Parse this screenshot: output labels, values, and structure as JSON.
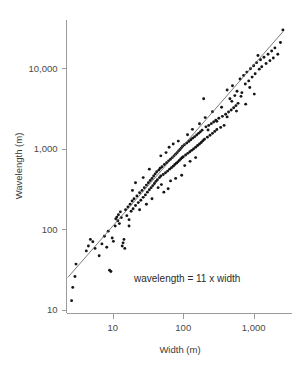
{
  "chart_data": {
    "type": "scatter",
    "title": "",
    "xlabel": "Width (m)",
    "ylabel": "Wavelength (m)",
    "xscale": "log",
    "yscale": "log",
    "xlim": [
      2.2,
      3500
    ],
    "ylim": [
      9,
      40000
    ],
    "grid": false,
    "legend": null,
    "xticks": [
      10,
      100,
      1000
    ],
    "xticklabels": [
      "10",
      "100",
      "1,000"
    ],
    "yticks": [
      10,
      100,
      1000,
      10000
    ],
    "yticklabels": [
      "10",
      "100",
      "1,000",
      "10,000"
    ],
    "annotation": "wavelength = 11 x width",
    "annotation_x": 20,
    "annotation_y": 22,
    "fit": {
      "label": "wavelength = 11 x width",
      "slope": 1,
      "intercept": 11,
      "x_start": 2.3,
      "x_end": 2600
    },
    "point_color": "#151515",
    "line_color": "#5a5a5a",
    "axis_color": "#9a9a9a",
    "text_color": "#4a4a4a",
    "points": [
      [
        2.6,
        13
      ],
      [
        2.7,
        19
      ],
      [
        2.9,
        26
      ],
      [
        3.0,
        37
      ],
      [
        4.2,
        54
      ],
      [
        4.5,
        62
      ],
      [
        4.8,
        75
      ],
      [
        5.2,
        70
      ],
      [
        5.6,
        58
      ],
      [
        6.4,
        47
      ],
      [
        7.0,
        66
      ],
      [
        7.6,
        82
      ],
      [
        8.2,
        60
      ],
      [
        8.6,
        95
      ],
      [
        9.0,
        31
      ],
      [
        9.4,
        30
      ],
      [
        9.8,
        78
      ],
      [
        10.2,
        71
      ],
      [
        10.8,
        110
      ],
      [
        11.0,
        135
      ],
      [
        11.4,
        142
      ],
      [
        11.8,
        128
      ],
      [
        12.0,
        152
      ],
      [
        12.4,
        118
      ],
      [
        12.8,
        165
      ],
      [
        13.2,
        140
      ],
      [
        13.6,
        62
      ],
      [
        14.0,
        68
      ],
      [
        14.4,
        75
      ],
      [
        14.8,
        58
      ],
      [
        15.2,
        175
      ],
      [
        15.8,
        148
      ],
      [
        16.4,
        190
      ],
      [
        17.0,
        132
      ],
      [
        17.6,
        205
      ],
      [
        18.2,
        168
      ],
      [
        18.8,
        225
      ],
      [
        19.4,
        180
      ],
      [
        20.0,
        240
      ],
      [
        21.0,
        198
      ],
      [
        22.0,
        260
      ],
      [
        23.0,
        215
      ],
      [
        24.0,
        285
      ],
      [
        25.0,
        230
      ],
      [
        26.0,
        305
      ],
      [
        27.0,
        250
      ],
      [
        28.0,
        330
      ],
      [
        29.0,
        268
      ],
      [
        30.0,
        355
      ],
      [
        31.0,
        290
      ],
      [
        32.0,
        380
      ],
      [
        33.0,
        310
      ],
      [
        34.0,
        405
      ],
      [
        35.0,
        330
      ],
      [
        36.0,
        430
      ],
      [
        37.0,
        350
      ],
      [
        38.0,
        460
      ],
      [
        39.0,
        372
      ],
      [
        40.0,
        490
      ],
      [
        41.0,
        395
      ],
      [
        42.0,
        520
      ],
      [
        43.0,
        415
      ],
      [
        44.0,
        330
      ],
      [
        45.0,
        545
      ],
      [
        46.0,
        440
      ],
      [
        47.0,
        575
      ],
      [
        48.0,
        460
      ],
      [
        49.0,
        360
      ],
      [
        50.0,
        600
      ],
      [
        52.0,
        480
      ],
      [
        54.0,
        640
      ],
      [
        56.0,
        505
      ],
      [
        58.0,
        675
      ],
      [
        60.0,
        530
      ],
      [
        62.0,
        710
      ],
      [
        64.0,
        560
      ],
      [
        66.0,
        745
      ],
      [
        68.0,
        585
      ],
      [
        70.0,
        780
      ],
      [
        72.0,
        610
      ],
      [
        74.0,
        820
      ],
      [
        76.0,
        640
      ],
      [
        78.0,
        860
      ],
      [
        80.0,
        665
      ],
      [
        82.0,
        900
      ],
      [
        84.0,
        690
      ],
      [
        86.0,
        945
      ],
      [
        88.0,
        720
      ],
      [
        90.0,
        985
      ],
      [
        92.0,
        750
      ],
      [
        94.0,
        1030
      ],
      [
        96.0,
        775
      ],
      [
        98.0,
        1080
      ],
      [
        100.0,
        800
      ],
      [
        104.0,
        1130
      ],
      [
        108.0,
        840
      ],
      [
        112.0,
        1180
      ],
      [
        116.0,
        880
      ],
      [
        120.0,
        1240
      ],
      [
        124.0,
        920
      ],
      [
        128.0,
        1300
      ],
      [
        132.0,
        960
      ],
      [
        136.0,
        1360
      ],
      [
        140.0,
        1000
      ],
      [
        145.0,
        1420
      ],
      [
        150.0,
        1050
      ],
      [
        155.0,
        1490
      ],
      [
        160.0,
        1100
      ],
      [
        165.0,
        1560
      ],
      [
        170.0,
        1150
      ],
      [
        175.0,
        1630
      ],
      [
        180.0,
        1200
      ],
      [
        185.0,
        1710
      ],
      [
        190.0,
        1260
      ],
      [
        195.0,
        4200
      ],
      [
        200.0,
        1320
      ],
      [
        210.0,
        1880
      ],
      [
        220.0,
        1400
      ],
      [
        230.0,
        1960
      ],
      [
        240.0,
        1480
      ],
      [
        250.0,
        2060
      ],
      [
        260.0,
        1560
      ],
      [
        270.0,
        2160
      ],
      [
        280.0,
        1650
      ],
      [
        290.0,
        2270
      ],
      [
        300.0,
        1740
      ],
      [
        320.0,
        2400
      ],
      [
        340.0,
        1850
      ],
      [
        360.0,
        2540
      ],
      [
        380.0,
        1960
      ],
      [
        400.0,
        2700
      ],
      [
        420.0,
        5400
      ],
      [
        440.0,
        2870
      ],
      [
        460.0,
        4200
      ],
      [
        480.0,
        3050
      ],
      [
        500.0,
        6100
      ],
      [
        520.0,
        3250
      ],
      [
        540.0,
        4600
      ],
      [
        560.0,
        3450
      ],
      [
        580.0,
        5200
      ],
      [
        600.0,
        3680
      ],
      [
        640.0,
        7400
      ],
      [
        680.0,
        5000
      ],
      [
        720.0,
        8200
      ],
      [
        760.0,
        6400
      ],
      [
        800.0,
        9000
      ],
      [
        850.0,
        7000
      ],
      [
        900.0,
        9900
      ],
      [
        950.0,
        7800
      ],
      [
        1000.0,
        10800
      ],
      [
        1050.0,
        8600
      ],
      [
        1100.0,
        11800
      ],
      [
        1150.0,
        14500
      ],
      [
        1200.0,
        9800
      ],
      [
        1250.0,
        12800
      ],
      [
        1300.0,
        10500
      ],
      [
        1400.0,
        13800
      ],
      [
        1500.0,
        11500
      ],
      [
        1600.0,
        15000
      ],
      [
        1700.0,
        12500
      ],
      [
        1800.0,
        16500
      ],
      [
        1900.0,
        13500
      ],
      [
        2000.0,
        18000
      ],
      [
        2200.0,
        15000
      ],
      [
        2400.0,
        21000
      ],
      [
        2600.0,
        30000
      ],
      [
        63.0,
        1050
      ],
      [
        66.0,
        400
      ],
      [
        72.0,
        1150
      ],
      [
        78.0,
        430
      ],
      [
        85.0,
        1250
      ],
      [
        95.0,
        470
      ],
      [
        105.0,
        620
      ],
      [
        115.0,
        1500
      ],
      [
        125.0,
        700
      ],
      [
        135.0,
        1750
      ],
      [
        150.0,
        780
      ],
      [
        170.0,
        2050
      ],
      [
        48.0,
        820
      ],
      [
        53.0,
        290
      ],
      [
        57.0,
        900
      ],
      [
        61.0,
        320
      ],
      [
        36.0,
        240
      ],
      [
        33.0,
        560
      ],
      [
        30.0,
        205
      ],
      [
        27.0,
        440
      ],
      [
        24.0,
        175
      ],
      [
        21.0,
        380
      ],
      [
        19.0,
        305
      ],
      [
        17.0,
        110
      ],
      [
        205.0,
        2450
      ],
      [
        225.0,
        1720
      ],
      [
        260.0,
        2900
      ],
      [
        300.0,
        2200
      ],
      [
        350.0,
        3300
      ],
      [
        420.0,
        2500
      ],
      [
        490.0,
        3900
      ],
      [
        570.0,
        2950
      ],
      [
        660.0,
        4500
      ],
      [
        770.0,
        3600
      ],
      [
        880.0,
        5800
      ],
      [
        1020.0,
        4800
      ]
    ]
  }
}
